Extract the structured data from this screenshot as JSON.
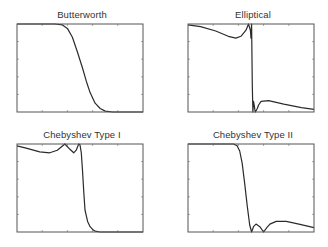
{
  "figure": {
    "panels": [
      {
        "title": "Butterworth"
      },
      {
        "title": "Elliptical"
      },
      {
        "title": "Chebyshev Type I"
      },
      {
        "title": "Chebyshev Type II"
      }
    ]
  },
  "colors": {
    "line": "#2b2b2b",
    "axes": "#555555",
    "tick": "#777777",
    "background": "#ffffff"
  },
  "chart_data": [
    {
      "type": "line",
      "title": "Butterworth",
      "xlabel": "",
      "ylabel": "",
      "xlim": [
        0,
        1
      ],
      "ylim": [
        0,
        1
      ],
      "grid": false,
      "x": [
        0,
        0.3,
        0.36,
        0.4,
        0.44,
        0.48,
        0.52,
        0.55,
        0.58,
        0.62,
        0.66,
        0.7,
        0.76,
        1
      ],
      "y": [
        1,
        1,
        0.99,
        0.95,
        0.85,
        0.68,
        0.5,
        0.35,
        0.22,
        0.1,
        0.04,
        0.01,
        0,
        0
      ]
    },
    {
      "type": "line",
      "title": "Elliptical",
      "xlabel": "",
      "ylabel": "",
      "xlim": [
        0,
        1
      ],
      "ylim": [
        0,
        1
      ],
      "grid": false,
      "x": [
        0,
        0.1,
        0.22,
        0.32,
        0.38,
        0.42,
        0.46,
        0.48,
        0.495,
        0.5,
        0.505,
        0.51,
        0.515,
        0.52,
        0.525,
        0.53,
        0.535,
        0.55,
        0.56,
        0.58,
        0.64,
        0.76,
        0.9,
        1
      ],
      "y": [
        0.99,
        0.97,
        0.92,
        0.86,
        0.84,
        0.86,
        0.93,
        1.0,
        0.93,
        0.84,
        1.0,
        0.3,
        0.0,
        0.12,
        0.08,
        0.03,
        0.0,
        0.04,
        0.08,
        0.12,
        0.13,
        0.09,
        0.05,
        0.03
      ]
    },
    {
      "type": "line",
      "title": "Chebyshev Type I",
      "xlabel": "",
      "ylabel": "",
      "xlim": [
        0,
        1
      ],
      "ylim": [
        0,
        1
      ],
      "grid": false,
      "x": [
        0,
        0.08,
        0.18,
        0.26,
        0.32,
        0.38,
        0.42,
        0.45,
        0.47,
        0.49,
        0.5,
        0.51,
        0.52,
        0.53,
        0.54,
        0.56,
        0.58,
        0.6,
        0.62,
        0.66,
        0.72,
        1
      ],
      "y": [
        0.98,
        0.95,
        0.91,
        0.9,
        0.93,
        1.0,
        0.94,
        0.9,
        0.93,
        1.0,
        0.99,
        0.9,
        0.7,
        0.45,
        0.25,
        0.12,
        0.06,
        0.03,
        0.01,
        0,
        0,
        0
      ]
    },
    {
      "type": "line",
      "title": "Chebyshev Type II",
      "xlabel": "",
      "ylabel": "",
      "xlim": [
        0,
        1
      ],
      "ylim": [
        0,
        1
      ],
      "grid": false,
      "x": [
        0,
        0.36,
        0.39,
        0.41,
        0.43,
        0.45,
        0.47,
        0.49,
        0.505,
        0.52,
        0.54,
        0.57,
        0.6,
        0.625,
        0.65,
        0.7,
        0.78,
        0.88,
        1
      ],
      "y": [
        1,
        1,
        0.98,
        0.92,
        0.78,
        0.55,
        0.3,
        0.08,
        0,
        0.06,
        0.09,
        0.06,
        0,
        0.05,
        0.09,
        0.12,
        0.12,
        0.09,
        0.05
      ]
    }
  ]
}
